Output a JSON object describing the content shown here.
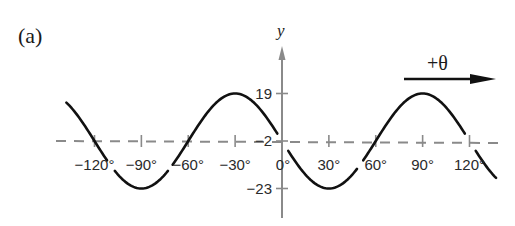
{
  "panel_label": "(a)",
  "direction_label": "+θ",
  "colors": {
    "curve": "#111111",
    "axis": "#8a8a8a",
    "midline": "#8a8a8a",
    "text": "#2a2a2a"
  },
  "chart_data": {
    "type": "line",
    "title": "",
    "panel": "(a)",
    "xlabel": "θ (degrees)",
    "ylabel": "y",
    "x_ticks": [
      -120,
      -90,
      -60,
      -30,
      0,
      30,
      60,
      90,
      120
    ],
    "x_tick_labels": [
      "−120°",
      "−90°",
      "−60°",
      "−30°",
      "0°",
      "30°",
      "60°",
      "90°",
      "120°"
    ],
    "y_ticks": [
      19,
      -2,
      -23
    ],
    "y_tick_labels": [
      "19",
      "−2",
      "−23"
    ],
    "xlim": [
      -138,
      137
    ],
    "ylim": [
      -23,
      19
    ],
    "grid": false,
    "midline": {
      "y": -2,
      "style": "dashed"
    },
    "function": "y = -2 - 21 sin(3θ)",
    "amplitude": 21,
    "midline_value": -2,
    "period_degrees": 120,
    "series": [
      {
        "name": "y",
        "x": [
          -135,
          -120,
          -105,
          -90,
          -75,
          -60,
          -45,
          -30,
          -15,
          0,
          15,
          30,
          45,
          60,
          75,
          90,
          105,
          120,
          135
        ],
        "values": [
          12.85,
          -2,
          -16.85,
          -23,
          -16.85,
          -2,
          12.85,
          19,
          12.85,
          -2,
          -16.85,
          -23,
          -16.85,
          -2,
          12.85,
          19,
          12.85,
          -2,
          -16.85
        ]
      }
    ],
    "annotations": [
      {
        "text": "+θ",
        "type": "arrow",
        "direction": "right"
      }
    ]
  }
}
